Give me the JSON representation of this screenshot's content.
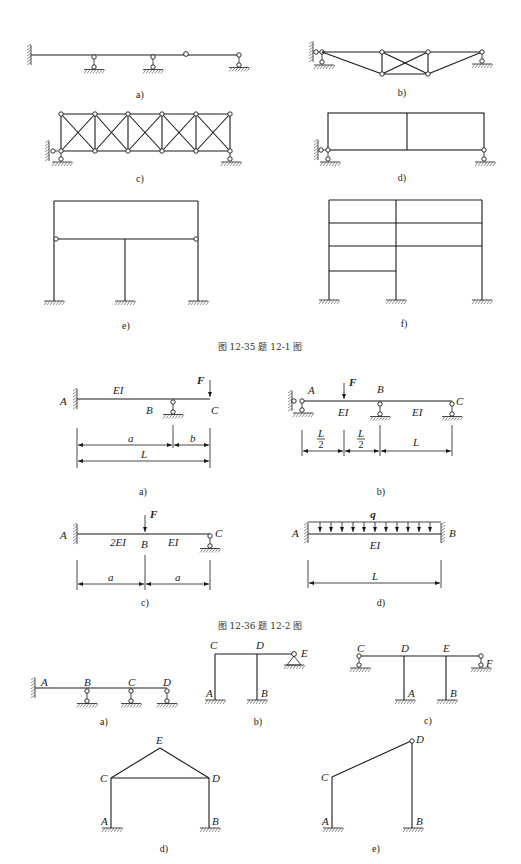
{
  "figure_12_35": {
    "caption": "图 12-35   题 12-1 图",
    "subfigures": [
      {
        "id": "a",
        "label": "a)"
      },
      {
        "id": "b",
        "label": "b)"
      },
      {
        "id": "c",
        "label": "c)"
      },
      {
        "id": "d",
        "label": "d)"
      },
      {
        "id": "e",
        "label": "e)"
      },
      {
        "id": "f",
        "label": "f)"
      }
    ]
  },
  "figure_12_36": {
    "caption": "图 12-36   题 12-2 图",
    "a": {
      "label": "a)",
      "A": "A",
      "B": "B",
      "C": "C",
      "EI": "EI",
      "F": "F",
      "dim_a": "a",
      "dim_b": "b",
      "dim_L": "L"
    },
    "b": {
      "label": "b)",
      "A": "A",
      "B": "B",
      "C": "C",
      "EI1": "EI",
      "EI2": "EI",
      "F": "F",
      "dim1_num": "L",
      "dim1_den": "2",
      "dim2_num": "L",
      "dim2_den": "2",
      "dim3": "L"
    },
    "c": {
      "label": "c)",
      "A": "A",
      "B": "B",
      "C": "C",
      "EI1": "2EI",
      "EI2": "EI",
      "F": "F",
      "dim1": "a",
      "dim2": "a"
    },
    "d": {
      "label": "d)",
      "A": "A",
      "B": "B",
      "EI": "EI",
      "q": "q",
      "dim_L": "L"
    }
  },
  "figure_12_37": {
    "a": {
      "label": "a)",
      "nodes": [
        "A",
        "B",
        "C",
        "D"
      ]
    },
    "b": {
      "label": "b)",
      "nodes": [
        "A",
        "B",
        "C",
        "D",
        "E"
      ]
    },
    "c": {
      "label": "c)",
      "nodes": [
        "A",
        "B",
        "C",
        "D",
        "E",
        "F"
      ]
    },
    "d": {
      "label": "d)",
      "nodes": [
        "A",
        "B",
        "C",
        "D",
        "E"
      ]
    },
    "e": {
      "label": "e)",
      "nodes": [
        "A",
        "B",
        "C",
        "D"
      ]
    }
  },
  "colors": {
    "line": "#1a1a1a",
    "background": "#ffffff"
  }
}
